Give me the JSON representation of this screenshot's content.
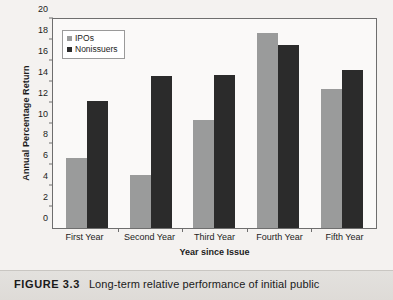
{
  "caption": {
    "figure_label": "FIGURE 3.3",
    "text": "Long-term relative performance of initial public"
  },
  "legend": {
    "items": [
      {
        "label": "IPOs",
        "color": "#9a9b9b"
      },
      {
        "label": "Nonissuers",
        "color": "#2b2b2b"
      }
    ]
  },
  "axes": {
    "y_title": "Annual Percentage Return",
    "x_title": "Year since Issue",
    "y_ticks": [
      "0",
      "2",
      "4",
      "6",
      "8",
      "10",
      "12",
      "14",
      "16",
      "18",
      "20"
    ]
  },
  "chart_data": {
    "type": "bar",
    "title": "",
    "xlabel": "Year since Issue",
    "ylabel": "Annual Percentage Return",
    "ylim": [
      0,
      20
    ],
    "ytick_step": 2,
    "grid": false,
    "legend_position": "top-left",
    "categories": [
      "First Year",
      "Second Year",
      "Third Year",
      "Fourth Year",
      "Fifth Year"
    ],
    "series": [
      {
        "name": "IPOs",
        "color": "#9a9b9b",
        "values": [
          6.7,
          5.1,
          10.35,
          18.65,
          13.35
        ]
      },
      {
        "name": "Nonissuers",
        "color": "#2b2b2b",
        "values": [
          12.2,
          14.55,
          14.6,
          17.55,
          15.1
        ]
      }
    ]
  }
}
